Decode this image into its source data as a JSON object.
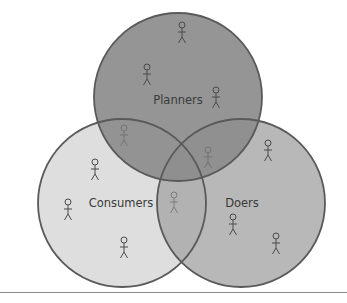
{
  "diagram": {
    "type": "venn",
    "sets": [
      {
        "id": "planners",
        "label": "Planners",
        "cx": 178,
        "cy": 97,
        "r": 84,
        "fill": "#8c8c8c",
        "stroke": "#5a5a5a",
        "opacity": 0.92,
        "label_x": 178,
        "label_y": 104,
        "figures": [
          [
            182,
            25
          ],
          [
            147,
            67
          ],
          [
            216,
            90
          ]
        ]
      },
      {
        "id": "consumers",
        "label": "Consumers",
        "cx": 122,
        "cy": 203,
        "r": 84,
        "fill": "#d6d6d6",
        "stroke": "#5a5a5a",
        "opacity": 0.8,
        "label_x": 121,
        "label_y": 207,
        "figures": [
          [
            95,
            162
          ],
          [
            68,
            202
          ],
          [
            124,
            240
          ]
        ]
      },
      {
        "id": "doers",
        "label": "Doers",
        "cx": 241,
        "cy": 203,
        "r": 84,
        "fill": "#a6a6a6",
        "stroke": "#5a5a5a",
        "opacity": 0.8,
        "label_x": 242,
        "label_y": 207,
        "figures": [
          [
            268,
            143
          ],
          [
            233,
            217
          ],
          [
            276,
            236
          ]
        ]
      }
    ],
    "overlap_figures": [
      {
        "between": "planners-consumers",
        "x": 124,
        "y": 128
      },
      {
        "between": "planners-doers",
        "x": 208,
        "y": 150
      },
      {
        "between": "consumers-doers",
        "x": 174,
        "y": 195
      }
    ]
  }
}
